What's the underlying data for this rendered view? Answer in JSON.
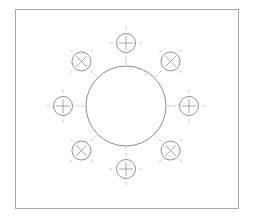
{
  "drawing": {
    "title": "",
    "description": "Flange bolt-hole pattern: central bore surrounded by 8 bolt holes on a bolt circle",
    "hole_count": 8,
    "colors": {
      "frame": "#a9a9a9",
      "outline": "#8c8c8c",
      "tick": "#b5b5b5",
      "background": "#ffffff"
    },
    "holes": [
      {
        "angle_deg": 90,
        "marker": "plus"
      },
      {
        "angle_deg": 45,
        "marker": "cross"
      },
      {
        "angle_deg": 0,
        "marker": "plus"
      },
      {
        "angle_deg": -45,
        "marker": "cross"
      },
      {
        "angle_deg": -90,
        "marker": "plus"
      },
      {
        "angle_deg": -135,
        "marker": "cross"
      },
      {
        "angle_deg": 180,
        "marker": "plus"
      },
      {
        "angle_deg": 135,
        "marker": "cross"
      }
    ]
  }
}
